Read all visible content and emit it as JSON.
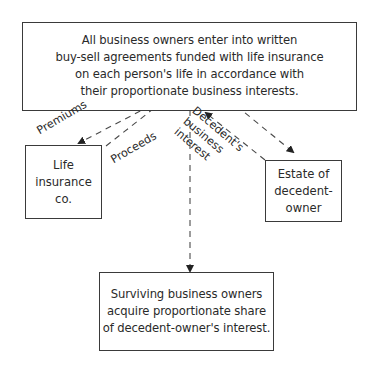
{
  "diagram": {
    "top_box": {
      "text": "All business owners enter into written\nbuy-sell agreements funded with life insurance\non each person's life in accordance with\ntheir proportionate business interests."
    },
    "life_box": {
      "text": "Life\ninsurance\nco."
    },
    "estate_box": {
      "text": "Estate of\ndecedent-\nowner"
    },
    "bottom_box": {
      "text": "Surviving business owners\nacquire proportionate share\nof decedent-owner's interest."
    },
    "labels": {
      "premiums": "Premiums",
      "proceeds": "Proceeds",
      "decedent_interest": "Decedent's\nbusiness\ninterest"
    },
    "colors": {
      "line": "#3a3a3a",
      "dash": "#4a4a4a",
      "background": "#ffffff"
    }
  }
}
